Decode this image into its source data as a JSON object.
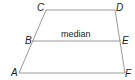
{
  "diagram": {
    "shape": "trapezoid",
    "line_color": "#9a9a9a",
    "text_color": "#222222",
    "vertices": [
      {
        "label": "C",
        "x": 46,
        "y": 10
      },
      {
        "label": "D",
        "x": 115,
        "y": 10
      },
      {
        "label": "F",
        "x": 125,
        "y": 73
      },
      {
        "label": "A",
        "x": 19,
        "y": 73
      }
    ],
    "median": {
      "label": "median",
      "start": {
        "label": "B",
        "x": 32,
        "y": 41
      },
      "end": {
        "label": "E",
        "x": 121,
        "y": 41
      }
    },
    "labels": {
      "A": "A",
      "B": "B",
      "C": "C",
      "D": "D",
      "E": "E",
      "F": "F",
      "median": "median"
    }
  }
}
